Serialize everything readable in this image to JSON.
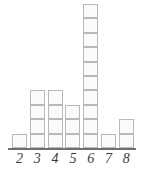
{
  "chart_data": {
    "type": "bar",
    "title": "",
    "subtitle": "",
    "xlabel": "",
    "ylabel": "",
    "categories": [
      "2",
      "3",
      "4",
      "5",
      "6",
      "7",
      "8"
    ],
    "values": [
      1,
      4,
      4,
      3,
      10,
      1,
      2
    ],
    "series": [
      {
        "name": "count",
        "values": [
          1,
          4,
          4,
          3,
          10,
          1,
          2
        ]
      }
    ],
    "unit_block": 1,
    "ylim": [
      0,
      10
    ],
    "grid": false,
    "legend": false,
    "legend_position": "none",
    "annotations": [],
    "style": {
      "block_fill": "#fbfbfb",
      "block_border": "#b9b9b9",
      "axis_color": "#6f6f6f",
      "label_color": "#3b3b3b",
      "background": "#ffffff"
    }
  }
}
